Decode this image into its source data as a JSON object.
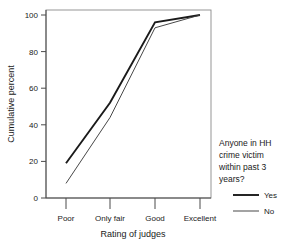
{
  "chart_data": {
    "type": "line",
    "title": "",
    "xlabel": "Rating of judges",
    "ylabel": "Cumulative percent",
    "categories": [
      "Poor",
      "Only fair",
      "Good",
      "Excellent"
    ],
    "ylim": [
      0,
      100
    ],
    "yticks": [
      0,
      20,
      40,
      60,
      80,
      100
    ],
    "ytick_labels": [
      "0",
      "20",
      "40",
      "60",
      "80",
      "100"
    ],
    "grid": false,
    "legend_position": "right",
    "legend_title": "Anyone in HH crime victim within past 3 years?",
    "series": [
      {
        "name": "Yes",
        "values": [
          19,
          52,
          96,
          100
        ],
        "color": "#1a1a1a"
      },
      {
        "name": "No",
        "values": [
          8,
          44,
          93,
          100
        ],
        "color": "#3d3d3d"
      }
    ]
  },
  "axes": {
    "y_title": "Cumulative percent",
    "x_title": "Rating of judges",
    "y_ticks": [
      "100",
      "80",
      "60",
      "40",
      "20",
      "0"
    ],
    "x_ticks": [
      "Poor",
      "Only fair",
      "Good",
      "Excellent"
    ]
  },
  "legend": {
    "title_lines": [
      "Anyone in HH",
      "crime victim",
      "within past 3",
      "years?"
    ],
    "entries": [
      {
        "label": "Yes"
      },
      {
        "label": "No"
      }
    ]
  }
}
